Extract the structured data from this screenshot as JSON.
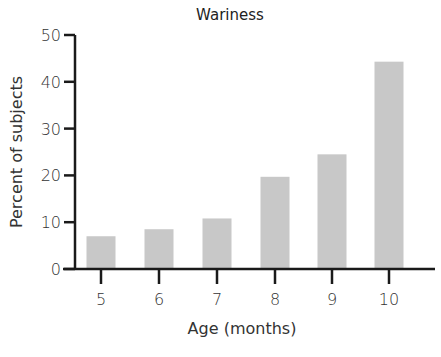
{
  "chart_data": {
    "type": "bar",
    "title": "Wariness",
    "xlabel": "Age (months)",
    "ylabel": "Percent of subjects",
    "categories": [
      "5",
      "6",
      "7",
      "8",
      "9",
      "10"
    ],
    "values": [
      7,
      8.5,
      10.8,
      19.7,
      24.5,
      44.3
    ],
    "ylim": [
      0,
      50
    ],
    "yticks": [
      0,
      10,
      20,
      30,
      40,
      50
    ],
    "grid": false,
    "legend": null,
    "bar_color": "#c8c8c8",
    "axis_color": "#1a1a1a"
  }
}
